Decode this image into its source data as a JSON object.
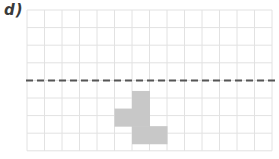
{
  "label": "d)",
  "grid": {
    "origin_x": 27,
    "origin_y": 10,
    "cell_w": 17.5,
    "cell_h": 17.6,
    "cols": 14,
    "rows": 8,
    "line_color": "#e2e2e2"
  },
  "mirror_line": {
    "style": "dashed",
    "row_index": 4,
    "color": "#555555"
  },
  "shape": {
    "fill": "#c8c8c8",
    "cells": [
      {
        "col": 6,
        "row": 4.6
      },
      {
        "col": 6,
        "row": 5.6
      },
      {
        "col": 6,
        "row": 6.6
      },
      {
        "col": 5,
        "row": 5.6
      },
      {
        "col": 7,
        "row": 6.6
      }
    ]
  }
}
